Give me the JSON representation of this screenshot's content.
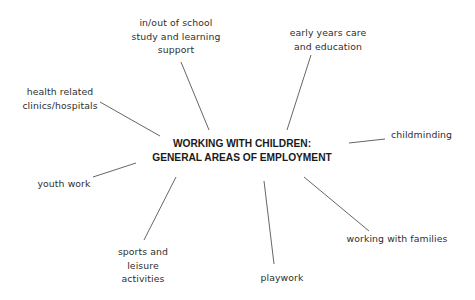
{
  "diagram": {
    "type": "mind-map",
    "center": {
      "line1": "WORKING WITH CHILDREN:",
      "line2": "GENERAL AREAS OF EMPLOYMENT"
    },
    "nodes": [
      {
        "id": "in-out-of-school",
        "lines": [
          "in/out of school",
          "study and learning",
          "support"
        ]
      },
      {
        "id": "early-years",
        "lines": [
          "early years care",
          "and education"
        ]
      },
      {
        "id": "health-related",
        "lines": [
          "health related",
          "clinics/hospitals"
        ]
      },
      {
        "id": "childminding",
        "lines": [
          "childminding"
        ]
      },
      {
        "id": "youth-work",
        "lines": [
          "youth work"
        ]
      },
      {
        "id": "sports-leisure",
        "lines": [
          "sports and",
          "leisure",
          "activities"
        ]
      },
      {
        "id": "playwork",
        "lines": [
          "playwork"
        ]
      },
      {
        "id": "working-with-families",
        "lines": [
          "working with families"
        ]
      }
    ],
    "colors": {
      "background": "#ffffff",
      "text": "#2e2e2e",
      "title": "#1a1a1a",
      "connector": "#555555"
    }
  }
}
